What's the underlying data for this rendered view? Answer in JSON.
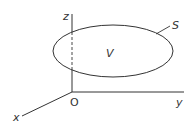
{
  "diagram": {
    "colors": {
      "stroke": "#333333",
      "background": "#ffffff"
    },
    "axes": {
      "origin_label": "O",
      "x_label": "x",
      "y_label": "y",
      "z_label": "z"
    },
    "surface_label": "S",
    "volume_label": "V"
  }
}
